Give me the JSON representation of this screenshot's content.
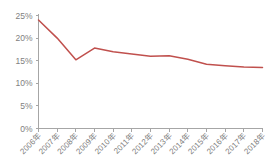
{
  "chart_data": {
    "type": "line",
    "title": "",
    "xlabel": "",
    "ylabel": "",
    "categories": [
      "2006年",
      "2007年",
      "2008年",
      "2009年",
      "2010年",
      "2011年",
      "2012年",
      "2013年",
      "2014年",
      "2015年",
      "2016年",
      "2017年",
      "2018年"
    ],
    "values": [
      24.0,
      20.0,
      15.2,
      17.8,
      17.0,
      16.5,
      16.0,
      16.1,
      15.3,
      14.2,
      13.9,
      13.6,
      13.5
    ],
    "series": [
      {
        "name": "",
        "values": [
          24.0,
          20.0,
          15.2,
          17.8,
          17.0,
          16.5,
          16.0,
          16.1,
          15.3,
          14.2,
          13.9,
          13.6,
          13.5
        ]
      }
    ],
    "ylim": [
      0,
      25
    ],
    "ytick_labels": [
      "0%",
      "5%",
      "10%",
      "15%",
      "20%",
      "25%"
    ],
    "ytick_values": [
      0,
      5,
      10,
      15,
      20,
      25
    ],
    "grid": false,
    "legend": null,
    "legend_position": "none",
    "line_color": "#C0504D",
    "axis_color": "#A6A6A6",
    "text_color": "#808080",
    "background_color": "#FFFFFF"
  }
}
